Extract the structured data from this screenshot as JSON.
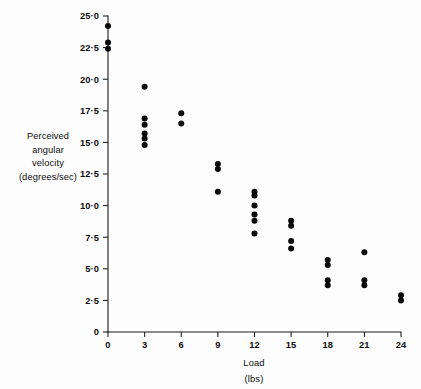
{
  "chart_data": {
    "type": "scatter",
    "title": "",
    "xlabel": "Load",
    "xlabel_units": "(lbs)",
    "ylabel_lines": [
      "Perceived",
      "angular",
      "velocity",
      "(degrees/sec)"
    ],
    "ylabel": "Perceived angular velocity (degrees/sec)",
    "xlim": [
      0,
      24
    ],
    "ylim": [
      0,
      25
    ],
    "xticks": [
      0,
      3,
      6,
      9,
      12,
      15,
      18,
      21,
      24
    ],
    "xtick_labels": [
      "0",
      "3",
      "6",
      "9",
      "12",
      "15",
      "18",
      "21",
      "24"
    ],
    "yticks": [
      0,
      2.5,
      5.0,
      7.5,
      10.0,
      12.5,
      15.0,
      17.5,
      20.0,
      22.5,
      25.0
    ],
    "ytick_labels": [
      "0",
      "2·5",
      "5·0",
      "7·5",
      "10·0",
      "12·5",
      "15·0",
      "17·5",
      "20·0",
      "22·5",
      "25·0"
    ],
    "grid": false,
    "legend": "none",
    "marker": "filled-circle",
    "marker_color": "#0a0a0a",
    "marker_size_px": 6,
    "points": [
      {
        "x": 0,
        "y": 24.2
      },
      {
        "x": 0,
        "y": 22.9
      },
      {
        "x": 0,
        "y": 22.4
      },
      {
        "x": 3,
        "y": 19.4
      },
      {
        "x": 3,
        "y": 16.9
      },
      {
        "x": 3,
        "y": 16.4
      },
      {
        "x": 3,
        "y": 15.7
      },
      {
        "x": 3,
        "y": 15.3
      },
      {
        "x": 3,
        "y": 14.8
      },
      {
        "x": 6,
        "y": 17.3
      },
      {
        "x": 6,
        "y": 16.5
      },
      {
        "x": 9,
        "y": 13.3
      },
      {
        "x": 9,
        "y": 12.9
      },
      {
        "x": 9,
        "y": 11.1
      },
      {
        "x": 12,
        "y": 11.1
      },
      {
        "x": 12,
        "y": 10.8
      },
      {
        "x": 12,
        "y": 10.0
      },
      {
        "x": 12,
        "y": 9.3
      },
      {
        "x": 12,
        "y": 8.8
      },
      {
        "x": 12,
        "y": 7.8
      },
      {
        "x": 15,
        "y": 8.8
      },
      {
        "x": 15,
        "y": 8.4
      },
      {
        "x": 15,
        "y": 7.2
      },
      {
        "x": 15,
        "y": 6.6
      },
      {
        "x": 18,
        "y": 5.7
      },
      {
        "x": 18,
        "y": 5.3
      },
      {
        "x": 18,
        "y": 4.1
      },
      {
        "x": 18,
        "y": 3.7
      },
      {
        "x": 21,
        "y": 6.3
      },
      {
        "x": 21,
        "y": 4.1
      },
      {
        "x": 21,
        "y": 3.7
      },
      {
        "x": 24,
        "y": 2.9
      },
      {
        "x": 24,
        "y": 2.5
      }
    ]
  },
  "colors": {
    "background": "#fdfdfd",
    "axis": "#1a1a1a",
    "marker": "#0a0a0a",
    "text": "#0d0d0d"
  }
}
